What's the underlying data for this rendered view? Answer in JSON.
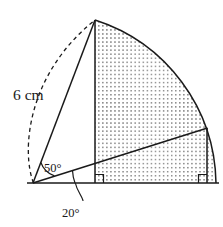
{
  "figure": {
    "background_color": "#ffffff",
    "stroke_color": "#1a1a1a",
    "shade_fill_color": "#6e6e6e",
    "width": 223,
    "height": 227
  },
  "labels": {
    "radius_length": "6 cm",
    "angle_upper": "50°",
    "angle_lower": "20°"
  },
  "geometry": {
    "origin": {
      "x": 33,
      "y": 183
    },
    "apex": {
      "x": 95,
      "y": 20
    },
    "baseline": {
      "x_start": 27,
      "x_end": 219,
      "y": 183
    },
    "vertical_left": {
      "x": 95,
      "y_top": 20,
      "y_bottom": 183
    },
    "vertical_right": {
      "x": 207,
      "y_top": 128,
      "y_bottom": 183
    },
    "chord_apex_to_origin": {
      "x1": 95,
      "y1": 20,
      "x2": 33,
      "y2": 183
    },
    "chord_origin_to_right": {
      "x1": 33,
      "y1": 183,
      "x2": 207,
      "y2": 128
    },
    "solid_arc": {
      "from": {
        "x": 95,
        "y": 20
      },
      "to": {
        "x": 216,
        "y": 183
      },
      "radius": 174,
      "center": {
        "x": 33,
        "y": 183
      }
    },
    "dashed_arc": {
      "from": {
        "x": 33,
        "y": 183
      },
      "to": {
        "x": 95,
        "y": 20
      },
      "bulge_left_x": 22
    },
    "right_angle_markers": [
      {
        "x": 95,
        "y": 183,
        "side": "right"
      },
      {
        "x": 207,
        "y": 183,
        "side": "left"
      }
    ],
    "angle_arcs": [
      {
        "name": "angle-50-arc",
        "vertex": {
          "x": 33,
          "y": 183
        },
        "radius": 22
      },
      {
        "name": "angle-20-arc",
        "vertex": {
          "x": 33,
          "y": 183
        },
        "radius": 42
      }
    ],
    "leader_line": {
      "from": {
        "x": 75,
        "y": 186
      },
      "to": {
        "x": 80,
        "y": 198
      }
    },
    "shaded_region_description": "Region bounded by vertical line at x=95, the solid circular arc, and the baseline"
  },
  "label_positions": {
    "radius_length": {
      "x": 13,
      "y": 100
    },
    "angle_upper": {
      "x": 44,
      "y": 172
    },
    "angle_lower": {
      "x": 62,
      "y": 216
    }
  }
}
